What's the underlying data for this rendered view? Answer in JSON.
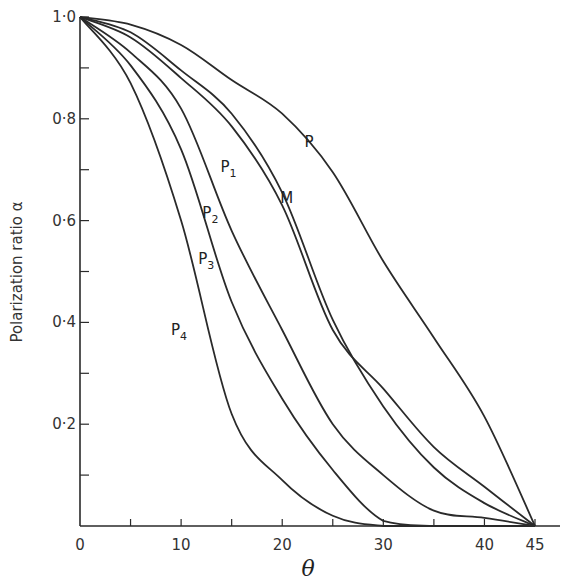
{
  "chart_data": {
    "type": "line",
    "title": "",
    "xlabel": "θ",
    "ylabel": "Polarization ratio α",
    "xlim": [
      0,
      45
    ],
    "ylim": [
      0,
      1.0
    ],
    "grid": false,
    "legend": "inline curve labels",
    "x_ticks": [
      0,
      5,
      10,
      15,
      20,
      25,
      30,
      35,
      40,
      45
    ],
    "x_tick_labels": [
      {
        "value": 0,
        "label": "0"
      },
      {
        "value": 10,
        "label": "10"
      },
      {
        "value": 20,
        "label": "20"
      },
      {
        "value": 30,
        "label": "30"
      },
      {
        "value": 40,
        "label": "40"
      },
      {
        "value": 45,
        "label": "45"
      }
    ],
    "y_ticks": [
      0.1,
      0.2,
      0.3,
      0.4,
      0.5,
      0.6,
      0.7,
      0.8,
      0.9,
      1.0
    ],
    "y_tick_labels": [
      {
        "value": 0.2,
        "label": "0·2"
      },
      {
        "value": 0.4,
        "label": "0·4"
      },
      {
        "value": 0.6,
        "label": "0·6"
      },
      {
        "value": 0.8,
        "label": "0·8"
      },
      {
        "value": 1.0,
        "label": "1·0"
      }
    ],
    "x": [
      0,
      5,
      10,
      15,
      20,
      25,
      30,
      35,
      40,
      45
    ],
    "series": [
      {
        "name": "P",
        "label_main": "P",
        "label_sub": "",
        "label_pos": [
          22.2,
          0.745
        ],
        "values": [
          1.0,
          0.985,
          0.945,
          0.876,
          0.81,
          0.695,
          0.52,
          0.37,
          0.215,
          0.0
        ]
      },
      {
        "name": "M",
        "label_main": "M",
        "label_sub": "",
        "label_pos": [
          19.8,
          0.635
        ],
        "values": [
          1.0,
          0.97,
          0.895,
          0.81,
          0.655,
          0.405,
          0.235,
          0.115,
          0.045,
          0.0
        ]
      },
      {
        "name": "P1",
        "label_main": "P",
        "label_sub": "1",
        "label_pos": [
          13.9,
          0.695
        ],
        "values": [
          1.0,
          0.96,
          0.88,
          0.785,
          0.63,
          0.385,
          0.27,
          0.155,
          0.077,
          0.0
        ]
      },
      {
        "name": "P2",
        "label_main": "P",
        "label_sub": "2",
        "label_pos": [
          12.1,
          0.605
        ],
        "values": [
          1.0,
          0.93,
          0.82,
          0.58,
          0.385,
          0.2,
          0.1,
          0.03,
          0.016,
          0.0
        ]
      },
      {
        "name": "P3",
        "label_main": "P",
        "label_sub": "3",
        "label_pos": [
          11.7,
          0.515
        ],
        "values": [
          1.0,
          0.905,
          0.74,
          0.44,
          0.25,
          0.11,
          0.01,
          0.0,
          0.0,
          0.0
        ]
      },
      {
        "name": "P4",
        "label_main": "P",
        "label_sub": "4",
        "label_pos": [
          9.0,
          0.375
        ],
        "values": [
          1.0,
          0.87,
          0.6,
          0.22,
          0.09,
          0.02,
          0.0,
          0.0,
          0.0,
          0.0
        ]
      }
    ]
  },
  "style": {
    "line_color": "#2a2a2a",
    "axis_color": "#2a2a2a",
    "background": "#ffffff"
  },
  "layout": {
    "x0_px": 80,
    "x45_px": 535,
    "y0_px": 526,
    "y1_px": 17,
    "axis_x_end_px": 560
  }
}
